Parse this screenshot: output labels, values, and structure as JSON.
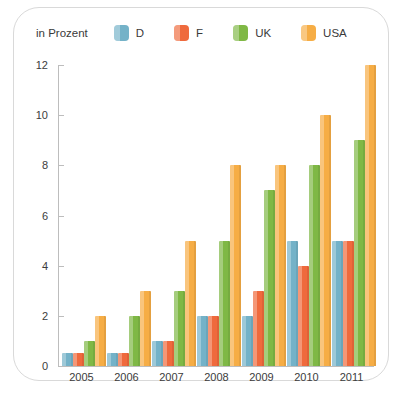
{
  "legend": {
    "title": "in Prozent",
    "items": [
      {
        "label": "D",
        "color": "#74b2c8"
      },
      {
        "label": "F",
        "color": "#ef6a3d"
      },
      {
        "label": "UK",
        "color": "#7fb845"
      },
      {
        "label": "USA",
        "color": "#f6ad45"
      }
    ]
  },
  "chart_data": {
    "type": "bar",
    "title": "",
    "subtitle": "",
    "xlabel": "",
    "ylabel": "in Prozent",
    "categories": [
      "2005",
      "2006",
      "2007",
      "2008",
      "2009",
      "2010",
      "2011"
    ],
    "series": [
      {
        "name": "D",
        "color": "#74b2c8",
        "values": [
          0.5,
          0.5,
          1,
          2,
          2,
          5,
          5
        ]
      },
      {
        "name": "F",
        "color": "#ef6a3d",
        "values": [
          0.5,
          0.5,
          1,
          2,
          3,
          4,
          5
        ]
      },
      {
        "name": "UK",
        "color": "#7fb845",
        "values": [
          1,
          2,
          3,
          5,
          7,
          8,
          9
        ]
      },
      {
        "name": "USA",
        "color": "#f6ad45",
        "values": [
          2,
          3,
          5,
          8,
          8,
          10,
          12
        ]
      }
    ],
    "ylim": [
      0,
      12
    ],
    "yticks": [
      0,
      2,
      4,
      6,
      8,
      10,
      12
    ],
    "ytick_labels": [
      "0",
      "2",
      "4",
      "6",
      "8",
      "10",
      "12"
    ],
    "grid": false,
    "legend_position": "top-left"
  }
}
